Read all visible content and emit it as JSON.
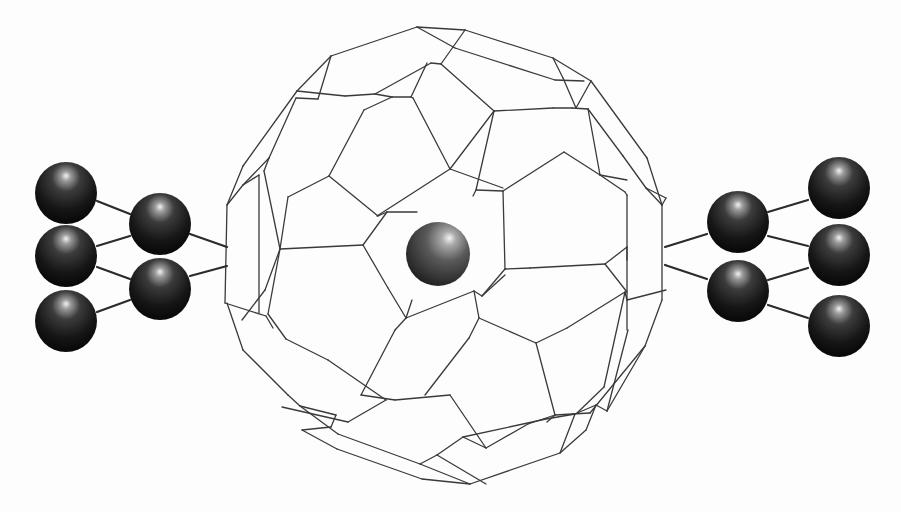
{
  "figure": {
    "background": "#fdfdfd",
    "atom_color_dark": "#101010",
    "atom_color_mid": "#3c3c3c",
    "atom_highlight": "#e8e8e8",
    "cage_line_color": "#3a3a3a"
  },
  "central_atom": {
    "cx": 438,
    "cy": 254,
    "r": 32
  },
  "left_cluster": {
    "atoms": [
      {
        "cx": 66,
        "cy": 193,
        "r": 31
      },
      {
        "cx": 66,
        "cy": 256,
        "r": 31
      },
      {
        "cx": 66,
        "cy": 321,
        "r": 31
      },
      {
        "cx": 160,
        "cy": 224,
        "r": 31
      },
      {
        "cx": 160,
        "cy": 289,
        "r": 31
      }
    ],
    "bonds": [
      [
        97,
        201,
        130,
        214
      ],
      [
        97,
        246,
        130,
        236
      ],
      [
        97,
        267,
        130,
        279
      ],
      [
        97,
        312,
        130,
        300
      ],
      [
        190,
        234,
        227,
        247
      ],
      [
        190,
        276,
        227,
        266
      ]
    ]
  },
  "right_cluster": {
    "atoms": [
      {
        "cx": 738,
        "cy": 222,
        "r": 31
      },
      {
        "cx": 738,
        "cy": 291,
        "r": 31
      },
      {
        "cx": 839,
        "cy": 188,
        "r": 31
      },
      {
        "cx": 839,
        "cy": 255,
        "r": 31
      },
      {
        "cx": 839,
        "cy": 326,
        "r": 31
      }
    ],
    "bonds": [
      [
        768,
        212,
        808,
        200
      ],
      [
        768,
        236,
        808,
        246
      ],
      [
        768,
        280,
        808,
        268
      ],
      [
        768,
        305,
        808,
        318
      ],
      [
        665,
        247,
        707,
        234
      ],
      [
        665,
        265,
        707,
        279
      ]
    ]
  },
  "cage_edges": [
    [
      417,
      27,
      465,
      30
    ],
    [
      417,
      27,
      331,
      56
    ],
    [
      465,
      30,
      553,
      58
    ],
    [
      553,
      58,
      591,
      81
    ],
    [
      331,
      56,
      297,
      91
    ],
    [
      297,
      91,
      243,
      166
    ],
    [
      591,
      81,
      647,
      158
    ],
    [
      647,
      158,
      662,
      205
    ],
    [
      243,
      166,
      227,
      205
    ],
    [
      417,
      27,
      455,
      48
    ],
    [
      465,
      30,
      441,
      64
    ],
    [
      441,
      64,
      431,
      63
    ],
    [
      431,
      63,
      375,
      94
    ],
    [
      455,
      48,
      555,
      80
    ],
    [
      375,
      94,
      345,
      96
    ],
    [
      345,
      96,
      297,
      91
    ],
    [
      375,
      94,
      392,
      97
    ],
    [
      331,
      56,
      318,
      99
    ],
    [
      318,
      99,
      296,
      98
    ],
    [
      555,
      80,
      584,
      81
    ],
    [
      553,
      58,
      563,
      78
    ],
    [
      563,
      78,
      576,
      108
    ],
    [
      576,
      108,
      591,
      81
    ],
    [
      441,
      64,
      494,
      111
    ],
    [
      494,
      111,
      553,
      108
    ],
    [
      553,
      108,
      572,
      108
    ],
    [
      392,
      97,
      411,
      97
    ],
    [
      411,
      97,
      427,
      63
    ],
    [
      392,
      97,
      364,
      110
    ],
    [
      364,
      110,
      329,
      176
    ],
    [
      296,
      98,
      269,
      158
    ],
    [
      411,
      97,
      413,
      98
    ],
    [
      413,
      98,
      450,
      169
    ],
    [
      450,
      169,
      494,
      111
    ],
    [
      494,
      111,
      476,
      190
    ],
    [
      476,
      190,
      473,
      196
    ],
    [
      269,
      158,
      243,
      185
    ],
    [
      269,
      158,
      264,
      171
    ],
    [
      243,
      185,
      227,
      205
    ],
    [
      329,
      176,
      288,
      197
    ],
    [
      329,
      176,
      378,
      216
    ],
    [
      264,
      171,
      280,
      249
    ],
    [
      288,
      197,
      280,
      249
    ],
    [
      450,
      169,
      377,
      216
    ],
    [
      450,
      169,
      503,
      188
    ],
    [
      476,
      190,
      503,
      191
    ],
    [
      503,
      191,
      564,
      152
    ],
    [
      564,
      152,
      600,
      175
    ],
    [
      572,
      108,
      588,
      109
    ],
    [
      588,
      109,
      600,
      175
    ],
    [
      600,
      175,
      627,
      180
    ],
    [
      588,
      109,
      623,
      156
    ],
    [
      623,
      156,
      646,
      188
    ],
    [
      646,
      188,
      662,
      205
    ],
    [
      600,
      175,
      625,
      192
    ],
    [
      625,
      192,
      627,
      195
    ],
    [
      627,
      195,
      627,
      330
    ],
    [
      646,
      188,
      666,
      198
    ],
    [
      666,
      198,
      662,
      205
    ],
    [
      662,
      205,
      662,
      300
    ],
    [
      227,
      205,
      225,
      303
    ],
    [
      243,
      185,
      259,
      175
    ],
    [
      259,
      175,
      259,
      313
    ],
    [
      280,
      249,
      363,
      245
    ],
    [
      363,
      245,
      387,
      212
    ],
    [
      387,
      212,
      417,
      212
    ],
    [
      378,
      216,
      387,
      212
    ],
    [
      503,
      191,
      505,
      269
    ],
    [
      505,
      269,
      530,
      268
    ],
    [
      530,
      268,
      605,
      264
    ],
    [
      605,
      264,
      627,
      247
    ],
    [
      363,
      245,
      388,
      288
    ],
    [
      388,
      288,
      406,
      318
    ],
    [
      406,
      318,
      412,
      300
    ],
    [
      505,
      269,
      482,
      296
    ],
    [
      482,
      296,
      505,
      275
    ],
    [
      280,
      249,
      265,
      290
    ],
    [
      265,
      290,
      242,
      320
    ],
    [
      225,
      303,
      266,
      316
    ],
    [
      266,
      316,
      273,
      328
    ],
    [
      227,
      303,
      243,
      350
    ],
    [
      243,
      350,
      288,
      395
    ],
    [
      288,
      395,
      300,
      406
    ],
    [
      280,
      249,
      268,
      314
    ],
    [
      268,
      314,
      286,
      339
    ],
    [
      286,
      339,
      328,
      360
    ],
    [
      328,
      360,
      386,
      400
    ],
    [
      386,
      400,
      348,
      422
    ],
    [
      348,
      422,
      282,
      407
    ],
    [
      406,
      318,
      474,
      291
    ],
    [
      474,
      291,
      482,
      296
    ],
    [
      406,
      318,
      395,
      330
    ],
    [
      395,
      330,
      361,
      395
    ],
    [
      474,
      291,
      479,
      318
    ],
    [
      479,
      318,
      536,
      343
    ],
    [
      536,
      343,
      567,
      328
    ],
    [
      567,
      328,
      625,
      292
    ],
    [
      625,
      292,
      627,
      300
    ],
    [
      627,
      300,
      666,
      290
    ],
    [
      605,
      264,
      627,
      292
    ],
    [
      627,
      247,
      627,
      260
    ],
    [
      479,
      318,
      469,
      338
    ],
    [
      469,
      338,
      425,
      395
    ],
    [
      536,
      343,
      555,
      415
    ],
    [
      555,
      415,
      547,
      422
    ],
    [
      361,
      395,
      395,
      400
    ],
    [
      395,
      400,
      450,
      395
    ],
    [
      450,
      395,
      486,
      448
    ],
    [
      486,
      448,
      528,
      424
    ],
    [
      528,
      424,
      555,
      415
    ],
    [
      555,
      415,
      590,
      413
    ],
    [
      590,
      413,
      645,
      346
    ],
    [
      645,
      346,
      662,
      300
    ],
    [
      625,
      292,
      604,
      387
    ],
    [
      604,
      387,
      577,
      413
    ],
    [
      300,
      406,
      336,
      415
    ],
    [
      336,
      415,
      331,
      427
    ],
    [
      331,
      427,
      302,
      430
    ],
    [
      300,
      406,
      338,
      434
    ],
    [
      338,
      434,
      420,
      464
    ],
    [
      420,
      464,
      437,
      455
    ],
    [
      302,
      430,
      337,
      449
    ],
    [
      337,
      449,
      422,
      479
    ],
    [
      422,
      479,
      470,
      484
    ],
    [
      470,
      484,
      560,
      453
    ],
    [
      560,
      453,
      586,
      430
    ],
    [
      586,
      430,
      596,
      405
    ],
    [
      596,
      405,
      607,
      411
    ],
    [
      607,
      411,
      645,
      346
    ],
    [
      437,
      455,
      463,
      437
    ],
    [
      463,
      437,
      546,
      419
    ],
    [
      546,
      419,
      575,
      414
    ],
    [
      575,
      414,
      596,
      405
    ],
    [
      420,
      464,
      470,
      484
    ],
    [
      437,
      455,
      486,
      484
    ],
    [
      486,
      448,
      463,
      437
    ],
    [
      560,
      453,
      575,
      414
    ],
    [
      607,
      411,
      628,
      330
    ]
  ]
}
